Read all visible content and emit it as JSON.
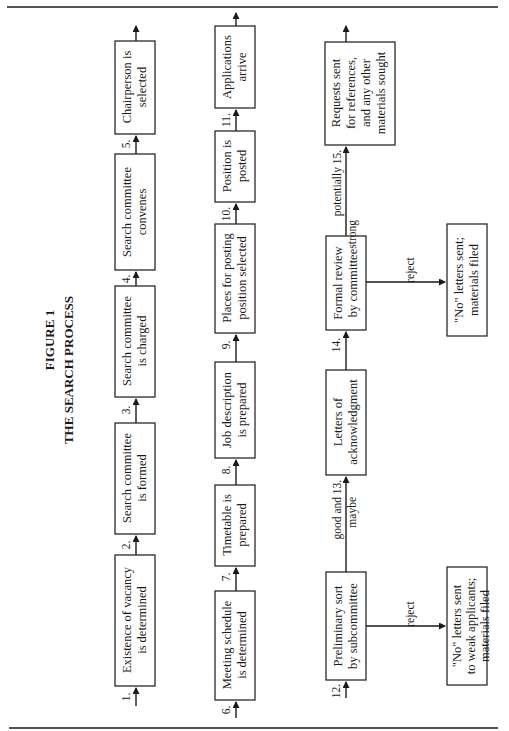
{
  "figure": {
    "number": "FIGURE 1",
    "title": "THE SEARCH PROCESS"
  },
  "steps": [
    {
      "num": "1.",
      "lines": [
        "Existence of vacancy",
        "is determined"
      ]
    },
    {
      "num": "2.",
      "lines": [
        "Search committee",
        "is formed"
      ]
    },
    {
      "num": "3.",
      "lines": [
        "Search committee",
        "is charged"
      ]
    },
    {
      "num": "4.",
      "lines": [
        "Search committee",
        "convenes"
      ]
    },
    {
      "num": "5.",
      "lines": [
        "Chairperson is",
        "selected"
      ]
    },
    {
      "num": "6.",
      "lines": [
        "Meeting schedule",
        "is determined"
      ]
    },
    {
      "num": "7.",
      "lines": [
        "Timetable is",
        "prepared"
      ]
    },
    {
      "num": "8.",
      "lines": [
        "Job description",
        "is prepared"
      ]
    },
    {
      "num": "9.",
      "lines": [
        "Places for posting",
        "position selected"
      ]
    },
    {
      "num": "10.",
      "lines": [
        "Position is",
        "posted"
      ]
    },
    {
      "num": "11.",
      "lines": [
        "Applications",
        "arrive"
      ]
    },
    {
      "num": "12.",
      "lines": [
        "Preliminary sort",
        "by subcommittee"
      ]
    },
    {
      "num": "13.",
      "lines": [
        "Letters of",
        "acknowledgment"
      ]
    },
    {
      "num": "14.",
      "lines": [
        "Formal review",
        "by committee"
      ]
    },
    {
      "num": "15.",
      "lines": [
        "Requests sent",
        "for references,",
        "and any other",
        "materials sought"
      ]
    }
  ],
  "reject_outcomes": [
    {
      "from": "12.",
      "edge_label": "reject",
      "lines": [
        "\"No\" letters sent",
        "to weak applicants;",
        "materials filed"
      ]
    },
    {
      "from": "14.",
      "edge_label": "reject",
      "lines": [
        "\"No\" letters sent;",
        "materials filed"
      ]
    }
  ],
  "edge_labels": {
    "to_13": [
      "good and",
      "maybe"
    ],
    "to_15": [
      "potentially",
      "strong"
    ]
  }
}
